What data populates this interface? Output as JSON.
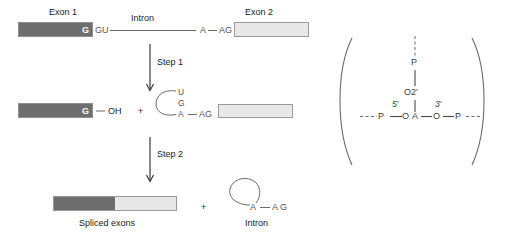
{
  "diagram": {
    "left_panel": {
      "row1": {
        "exon1_label": "Exon 1",
        "exon1_terminal_base": "G",
        "donor_site": "GU",
        "intron_label": "Intron",
        "branch_base": "A",
        "acceptor_site": "AG",
        "exon2_label": "Exon 2"
      },
      "step1": {
        "label": "Step 1",
        "exon1_terminal_base": "G",
        "free_hydroxyl": "OH",
        "plus": "+",
        "lariat_bases": [
          "U",
          "G",
          "A"
        ],
        "acceptor_site": "AG"
      },
      "step2": {
        "label": "Step 2",
        "product_label": "Spliced exons",
        "plus": "+",
        "intron_branch_base": "A",
        "intron_acceptor": "A G",
        "intron_label": "Intron"
      }
    },
    "right_panel": {
      "branch_phosphate": "P",
      "branch_oxygen": "O2′",
      "left_phosphate": "P",
      "left_oxygen": "O",
      "five_prime": "5′",
      "adenosine": "A",
      "three_prime": "3′",
      "right_oxygen": "O",
      "right_phosphate": "P"
    }
  },
  "colors": {
    "exon1_fill": "#6e6e6e",
    "exon2_fill": "#e8e8e8",
    "bar_border": "#9a9a9a",
    "line": "#6b6b6b",
    "text": "#1a1a1a"
  }
}
